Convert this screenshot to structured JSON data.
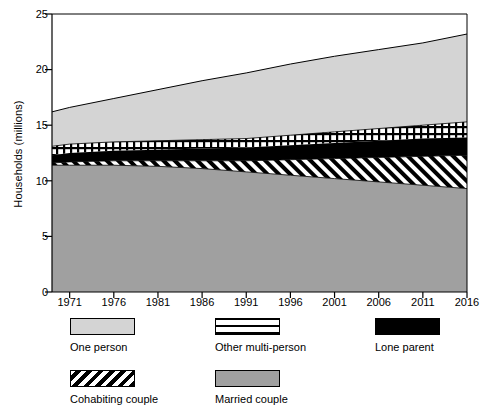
{
  "chart_data": {
    "type": "area",
    "title": "",
    "subtitle": "",
    "xlabel": "",
    "ylabel": "Households (millions)",
    "xlim": [
      1969,
      2016
    ],
    "ylim": [
      0,
      25
    ],
    "yticks": [
      0,
      5,
      10,
      15,
      20,
      25
    ],
    "xticks": [
      1971,
      1976,
      1981,
      1986,
      1991,
      1996,
      2001,
      2006,
      2011,
      2016
    ],
    "grid": false,
    "legend_position": "below",
    "stacked": true,
    "stack_order_bottom_to_top": [
      "Married couple",
      "Cohabiting couple",
      "Lone parent",
      "Other multi-person",
      "One person"
    ],
    "x": [
      1969,
      1971,
      1976,
      1981,
      1986,
      1991,
      1996,
      2001,
      2006,
      2011,
      2016
    ],
    "series": [
      {
        "name": "Married couple",
        "pattern": "solid-mid-grey",
        "color": "#a0a0a0",
        "values": [
          11.4,
          11.4,
          11.4,
          11.3,
          11.1,
          10.8,
          10.5,
          10.2,
          9.9,
          9.6,
          9.3
        ]
      },
      {
        "name": "Cohabiting couple",
        "pattern": "diagonal-hatch",
        "color": "#ffffff",
        "values": [
          0.2,
          0.3,
          0.4,
          0.5,
          0.7,
          1.0,
          1.4,
          1.8,
          2.2,
          2.6,
          3.0
        ]
      },
      {
        "name": "Lone parent",
        "pattern": "solid-black",
        "color": "#000000",
        "values": [
          0.7,
          0.8,
          0.9,
          1.0,
          1.1,
          1.2,
          1.3,
          1.4,
          1.5,
          1.6,
          1.6
        ]
      },
      {
        "name": "Other multi-person",
        "pattern": "cross-hatch-grid",
        "color": "#ffffff",
        "values": [
          0.8,
          0.8,
          0.8,
          0.8,
          0.8,
          0.8,
          0.9,
          1.0,
          1.1,
          1.2,
          1.4
        ]
      },
      {
        "name": "One person",
        "pattern": "solid-light-grey",
        "color": "#d4d4d4",
        "values": [
          3.1,
          3.3,
          3.9,
          4.6,
          5.3,
          5.9,
          6.4,
          6.8,
          7.1,
          7.4,
          7.9
        ]
      }
    ],
    "cumulative_totals": [
      16.2,
      16.6,
      17.4,
      18.2,
      19.0,
      19.7,
      20.5,
      21.2,
      21.8,
      22.4,
      23.2
    ],
    "legend": [
      {
        "label": "One person",
        "swatch": "solid-light-grey"
      },
      {
        "label": "Other multi-person",
        "swatch": "cross-hatch-grid"
      },
      {
        "label": "Lone parent",
        "swatch": "solid-black"
      },
      {
        "label": "Cohabiting couple",
        "swatch": "diagonal-hatch"
      },
      {
        "label": "Married couple",
        "swatch": "solid-mid-grey"
      }
    ]
  },
  "axes": {
    "y_title": "Households (millions)",
    "y_ticks": [
      "0",
      "5",
      "10",
      "15",
      "20",
      "25"
    ],
    "x_ticks": [
      "1971",
      "1976",
      "1981",
      "1986",
      "1991",
      "1996",
      "2001",
      "2006",
      "2011",
      "2016"
    ]
  },
  "legend": {
    "items": [
      {
        "label": "One person"
      },
      {
        "label": "Other multi-person"
      },
      {
        "label": "Lone parent"
      },
      {
        "label": "Cohabiting couple"
      },
      {
        "label": "Married couple"
      }
    ]
  },
  "colors": {
    "one_person": "#d4d4d4",
    "married_couple": "#a0a0a0",
    "lone_parent": "#000000",
    "axis": "#000000",
    "background": "#ffffff"
  }
}
